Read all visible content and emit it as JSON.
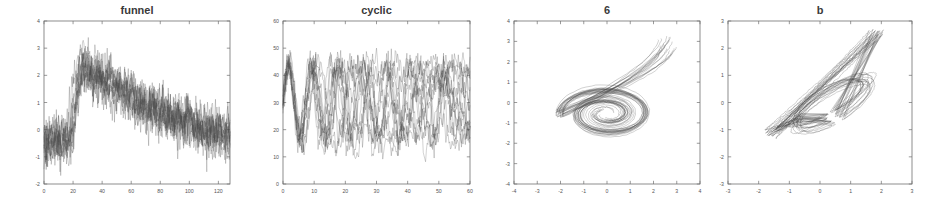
{
  "figure": {
    "width": 951,
    "height": 211,
    "background": "#ffffff",
    "line_color": "#4a4a4a",
    "axis_color": "#707070",
    "text_color": "#555555",
    "title_color": "#3a3a3a",
    "panel_count": 4
  },
  "chart_data": [
    {
      "id": "funnel",
      "type": "line",
      "title": "funnel",
      "xlabel": "",
      "ylabel": "",
      "xlim": [
        0,
        128
      ],
      "ylim": [
        -2,
        4
      ],
      "xticks": [
        0,
        20,
        40,
        60,
        80,
        100,
        120
      ],
      "yticks": [
        -2,
        -1,
        0,
        1,
        2,
        3,
        4
      ],
      "grid": false,
      "legend": "none",
      "n_series": 12,
      "description": "Overlaid noisy time series: flat baseline near -0.4 until t=18, abrupt ramp up to a peak near 2.2 around t=26-32, then a slow linear decay back to about -0.4 by t=128; heavy high-frequency noise throughout.",
      "profile_x": [
        0,
        6,
        12,
        18,
        21,
        24,
        26,
        30,
        34,
        40,
        50,
        60,
        70,
        80,
        90,
        100,
        110,
        120,
        128
      ],
      "profile_y": [
        -0.4,
        -0.45,
        -0.4,
        -0.45,
        0.9,
        1.9,
        2.2,
        2.0,
        1.85,
        1.7,
        1.45,
        1.1,
        0.75,
        0.6,
        0.4,
        0.2,
        0.0,
        -0.2,
        -0.3
      ],
      "noise_amplitude": 0.75,
      "peak_value": 3.2,
      "min_value": -2.0
    },
    {
      "id": "cyclic",
      "type": "line",
      "title": "cyclic",
      "xlabel": "",
      "ylabel": "",
      "xlim": [
        0,
        60
      ],
      "ylim": [
        0,
        60
      ],
      "xticks": [
        0,
        10,
        20,
        30,
        40,
        50,
        60
      ],
      "yticks": [
        0,
        10,
        20,
        30,
        40,
        50,
        60
      ],
      "grid": false,
      "legend": "none",
      "n_series": 14,
      "description": "Overlaid noisy sinusoids, mean 30, amplitude about 14, period about 7.5 samples; initially phase aligned so two clear cycles are visible, progressively dephasing into a dense band spanning roughly 10 to 50.",
      "mean_level": 30,
      "amplitude": 14,
      "period": 7.5,
      "noise_amplitude": 3.2,
      "band_min": 10,
      "band_max": 50
    },
    {
      "id": "panel6",
      "type": "line",
      "title": "6",
      "xlabel": "",
      "ylabel": "",
      "xlim": [
        -4,
        4
      ],
      "ylim": [
        -4,
        4
      ],
      "xticks": [
        -4,
        -3,
        -2,
        -1,
        0,
        1,
        2,
        3,
        4
      ],
      "yticks": [
        -4,
        -3,
        -2,
        -1,
        0,
        1,
        2,
        3,
        4
      ],
      "grid": false,
      "legend": "none",
      "n_series": 18,
      "description": "2-D projection of overlaid trajectories forming a spiral / scroll shape: a tail entering from the upper right near (2.5, 2.7), sweeping left to about (-1.8, 0.2) then curling clockwise into a tight elliptical cluster centred near (0.0, -0.55) spanning roughly x in [-1.7, 1.9] and y in [-1.4, 0.2].",
      "cluster_center": [
        0.0,
        -0.55
      ],
      "cluster_extent_x": [
        -1.7,
        1.9
      ],
      "cluster_extent_y": [
        -1.4,
        0.2
      ],
      "tail_start": [
        2.6,
        2.8
      ],
      "tail_end": [
        -1.8,
        0.2
      ]
    },
    {
      "id": "panelb",
      "type": "line",
      "title": "b",
      "xlabel": "",
      "ylabel": "",
      "xlim": [
        -3,
        3
      ],
      "ylim": [
        -3,
        3
      ],
      "xticks": [
        -3,
        -2,
        -1,
        0,
        1,
        2,
        3
      ],
      "yticks": [
        -3,
        -2,
        -1,
        0,
        1,
        2,
        3
      ],
      "grid": false,
      "legend": "none",
      "n_series": 18,
      "description": "2-D projection of overlaid trajectories forming a diagonal lasso: a tight bundle of near-straight strands running from about (-1.6, -1.2) up to (1.8, 2.5), with the strands opening into a narrow elongated loop between roughly (-1.2, -0.8) and (1.9, 0.9).",
      "bundle_start": [
        -1.6,
        -1.1
      ],
      "bundle_end": [
        1.8,
        2.5
      ],
      "loop_extent_x": [
        -1.2,
        1.9
      ],
      "loop_extent_y": [
        -1.0,
        1.0
      ]
    }
  ],
  "panels": [
    {
      "name": "funnel-panel",
      "plot_rect": {
        "x": 44,
        "y": 21,
        "width": 186,
        "height": 163
      },
      "title_y": 14
    },
    {
      "name": "cyclic-panel",
      "plot_rect": {
        "x": 283,
        "y": 21,
        "width": 187,
        "height": 163
      },
      "title_y": 14
    },
    {
      "name": "panel-6",
      "plot_rect": {
        "x": 514,
        "y": 21,
        "width": 186,
        "height": 163
      },
      "title_y": 14
    },
    {
      "name": "panel-b",
      "plot_rect": {
        "x": 728,
        "y": 21,
        "width": 184,
        "height": 163
      },
      "title_y": 14
    }
  ]
}
